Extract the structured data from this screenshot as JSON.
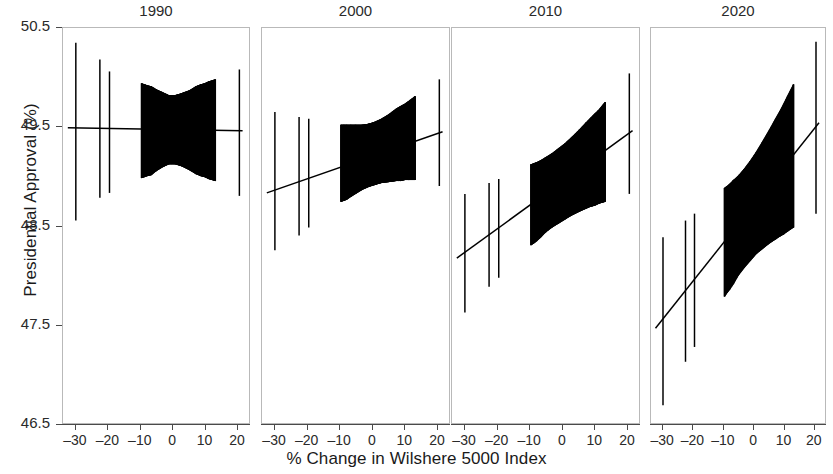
{
  "chart_data": {
    "type": "scatter",
    "title": "",
    "xlabel": "% Change in Wilshere 5000 Index",
    "ylabel": "Presidential Approval (%)",
    "xlim": [
      -34,
      24
    ],
    "ylim": [
      46.5,
      50.5
    ],
    "xticks": [
      -30,
      -20,
      -10,
      0,
      10,
      20
    ],
    "xticklabels": [
      "–30",
      "–20",
      "–10",
      "0",
      "10",
      "20"
    ],
    "yticks": [
      46.5,
      47.5,
      48.5,
      49.5,
      50.5
    ],
    "yticklabels": [
      "46.5",
      "47.5",
      "48.5",
      "49.5",
      "50.5"
    ],
    "grid": false,
    "legend": null,
    "facet_variable": "year",
    "facets": [
      {
        "label": "1990",
        "slope": -0.004,
        "intercept": 49.47,
        "fit_line": [
          {
            "x": -32.5,
            "y": 49.49
          },
          {
            "x": 22.0,
            "y": 49.46
          }
        ],
        "points": [
          {
            "x": -30.0,
            "y": 49.49,
            "ylow": 48.55,
            "yhigh": 50.35
          },
          {
            "x": -22.5,
            "y": 49.49,
            "ylow": 48.78,
            "yhigh": 50.18
          },
          {
            "x": -19.5,
            "y": 49.49,
            "ylow": 48.83,
            "yhigh": 50.06
          },
          {
            "x": -9.5,
            "y": 49.48,
            "ylow": 48.98,
            "yhigh": 49.94
          },
          {
            "x": -8.6,
            "y": 49.48,
            "ylow": 48.99,
            "yhigh": 49.93
          },
          {
            "x": -7.8,
            "y": 49.48,
            "ylow": 49.0,
            "yhigh": 49.92
          },
          {
            "x": -6.5,
            "y": 49.48,
            "ylow": 49.01,
            "yhigh": 49.91
          },
          {
            "x": -5.0,
            "y": 49.48,
            "ylow": 49.05,
            "yhigh": 49.88
          },
          {
            "x": -3.0,
            "y": 49.48,
            "ylow": 49.09,
            "yhigh": 49.85
          },
          {
            "x": -1.0,
            "y": 49.47,
            "ylow": 49.12,
            "yhigh": 49.82
          },
          {
            "x": 1.0,
            "y": 49.47,
            "ylow": 49.12,
            "yhigh": 49.82
          },
          {
            "x": 3.0,
            "y": 49.47,
            "ylow": 49.1,
            "yhigh": 49.84
          },
          {
            "x": 5.5,
            "y": 49.47,
            "ylow": 49.06,
            "yhigh": 49.87
          },
          {
            "x": 7.5,
            "y": 49.47,
            "ylow": 49.02,
            "yhigh": 49.91
          },
          {
            "x": 9.0,
            "y": 49.47,
            "ylow": 49.0,
            "yhigh": 49.93
          },
          {
            "x": 10.2,
            "y": 49.47,
            "ylow": 48.99,
            "yhigh": 49.94
          },
          {
            "x": 11.5,
            "y": 49.46,
            "ylow": 48.97,
            "yhigh": 49.96
          },
          {
            "x": 13.5,
            "y": 49.46,
            "ylow": 48.95,
            "yhigh": 49.98
          },
          {
            "x": 21.0,
            "y": 49.46,
            "ylow": 48.8,
            "yhigh": 50.08
          }
        ]
      },
      {
        "label": "2000",
        "slope": 0.012,
        "intercept": 49.25,
        "fit_line": [
          {
            "x": -32.5,
            "y": 48.83
          },
          {
            "x": 22.0,
            "y": 49.45
          }
        ],
        "points": [
          {
            "x": -30.0,
            "y": 48.86,
            "ylow": 48.25,
            "yhigh": 49.65
          },
          {
            "x": -22.5,
            "y": 48.95,
            "ylow": 48.4,
            "yhigh": 49.6
          },
          {
            "x": -19.5,
            "y": 48.98,
            "ylow": 48.48,
            "yhigh": 49.58
          },
          {
            "x": -9.5,
            "y": 49.1,
            "ylow": 48.74,
            "yhigh": 49.52
          },
          {
            "x": -8.6,
            "y": 49.11,
            "ylow": 48.75,
            "yhigh": 49.52
          },
          {
            "x": -7.8,
            "y": 49.12,
            "ylow": 48.76,
            "yhigh": 49.52
          },
          {
            "x": -6.5,
            "y": 49.13,
            "ylow": 48.79,
            "yhigh": 49.52
          },
          {
            "x": -5.0,
            "y": 49.15,
            "ylow": 48.82,
            "yhigh": 49.52
          },
          {
            "x": -3.0,
            "y": 49.18,
            "ylow": 48.86,
            "yhigh": 49.52
          },
          {
            "x": -1.0,
            "y": 49.2,
            "ylow": 48.89,
            "yhigh": 49.53
          },
          {
            "x": 1.0,
            "y": 49.22,
            "ylow": 48.91,
            "yhigh": 49.55
          },
          {
            "x": 3.0,
            "y": 49.25,
            "ylow": 48.93,
            "yhigh": 49.58
          },
          {
            "x": 5.5,
            "y": 49.28,
            "ylow": 48.94,
            "yhigh": 49.63
          },
          {
            "x": 7.5,
            "y": 49.3,
            "ylow": 48.95,
            "yhigh": 49.68
          },
          {
            "x": 9.0,
            "y": 49.32,
            "ylow": 48.95,
            "yhigh": 49.71
          },
          {
            "x": 10.2,
            "y": 49.34,
            "ylow": 48.96,
            "yhigh": 49.73
          },
          {
            "x": 11.5,
            "y": 49.35,
            "ylow": 48.96,
            "yhigh": 49.76
          },
          {
            "x": 13.5,
            "y": 49.38,
            "ylow": 48.96,
            "yhigh": 49.81
          },
          {
            "x": 21.0,
            "y": 49.45,
            "ylow": 48.9,
            "yhigh": 49.98
          }
        ]
      },
      {
        "label": "2010",
        "slope": 0.024,
        "intercept": 48.92,
        "fit_line": [
          {
            "x": -32.5,
            "y": 48.17
          },
          {
            "x": 22.0,
            "y": 49.46
          }
        ],
        "points": [
          {
            "x": -30.0,
            "y": 48.22,
            "ylow": 47.62,
            "yhigh": 48.82
          },
          {
            "x": -22.5,
            "y": 48.4,
            "ylow": 47.88,
            "yhigh": 48.93
          },
          {
            "x": -19.5,
            "y": 48.47,
            "ylow": 47.97,
            "yhigh": 48.97
          },
          {
            "x": -9.5,
            "y": 48.7,
            "ylow": 48.3,
            "yhigh": 49.12
          },
          {
            "x": -8.6,
            "y": 48.72,
            "ylow": 48.32,
            "yhigh": 49.13
          },
          {
            "x": -7.8,
            "y": 48.74,
            "ylow": 48.34,
            "yhigh": 49.14
          },
          {
            "x": -6.5,
            "y": 48.77,
            "ylow": 48.38,
            "yhigh": 49.16
          },
          {
            "x": -5.0,
            "y": 48.81,
            "ylow": 48.43,
            "yhigh": 49.19
          },
          {
            "x": -3.0,
            "y": 48.85,
            "ylow": 48.48,
            "yhigh": 49.23
          },
          {
            "x": -1.0,
            "y": 48.9,
            "ylow": 48.52,
            "yhigh": 49.28
          },
          {
            "x": 1.0,
            "y": 48.95,
            "ylow": 48.56,
            "yhigh": 49.33
          },
          {
            "x": 3.0,
            "y": 49.0,
            "ylow": 48.6,
            "yhigh": 49.39
          },
          {
            "x": 5.5,
            "y": 49.06,
            "ylow": 48.64,
            "yhigh": 49.47
          },
          {
            "x": 7.5,
            "y": 49.1,
            "ylow": 48.67,
            "yhigh": 49.54
          },
          {
            "x": 9.0,
            "y": 49.14,
            "ylow": 48.69,
            "yhigh": 49.59
          },
          {
            "x": 10.2,
            "y": 49.17,
            "ylow": 48.7,
            "yhigh": 49.63
          },
          {
            "x": 11.5,
            "y": 49.2,
            "ylow": 48.72,
            "yhigh": 49.67
          },
          {
            "x": 13.5,
            "y": 49.24,
            "ylow": 48.74,
            "yhigh": 49.75
          },
          {
            "x": 21.0,
            "y": 49.45,
            "ylow": 48.82,
            "yhigh": 50.04
          }
        ]
      },
      {
        "label": "2020",
        "slope": 0.038,
        "intercept": 48.7,
        "fit_line": [
          {
            "x": -32.5,
            "y": 47.46
          },
          {
            "x": 22.0,
            "y": 49.54
          }
        ],
        "points": [
          {
            "x": -30.0,
            "y": 47.54,
            "ylow": 46.68,
            "yhigh": 48.38
          },
          {
            "x": -22.5,
            "y": 47.83,
            "ylow": 47.12,
            "yhigh": 48.55
          },
          {
            "x": -19.5,
            "y": 47.94,
            "ylow": 47.27,
            "yhigh": 48.62
          },
          {
            "x": -9.5,
            "y": 48.32,
            "ylow": 47.78,
            "yhigh": 48.88
          },
          {
            "x": -8.6,
            "y": 48.36,
            "ylow": 47.82,
            "yhigh": 48.9
          },
          {
            "x": -7.8,
            "y": 48.39,
            "ylow": 47.85,
            "yhigh": 48.92
          },
          {
            "x": -6.5,
            "y": 48.44,
            "ylow": 47.91,
            "yhigh": 48.96
          },
          {
            "x": -5.0,
            "y": 48.5,
            "ylow": 47.99,
            "yhigh": 49.0
          },
          {
            "x": -3.0,
            "y": 48.57,
            "ylow": 48.07,
            "yhigh": 49.07
          },
          {
            "x": -1.0,
            "y": 48.65,
            "ylow": 48.14,
            "yhigh": 49.15
          },
          {
            "x": 1.0,
            "y": 48.73,
            "ylow": 48.21,
            "yhigh": 49.24
          },
          {
            "x": 3.0,
            "y": 48.8,
            "ylow": 48.26,
            "yhigh": 49.34
          },
          {
            "x": 5.5,
            "y": 48.9,
            "ylow": 48.32,
            "yhigh": 49.47
          },
          {
            "x": 7.5,
            "y": 48.97,
            "ylow": 48.36,
            "yhigh": 49.58
          },
          {
            "x": 9.0,
            "y": 49.03,
            "ylow": 48.39,
            "yhigh": 49.66
          },
          {
            "x": 10.2,
            "y": 49.08,
            "ylow": 48.41,
            "yhigh": 49.73
          },
          {
            "x": 11.5,
            "y": 49.13,
            "ylow": 48.44,
            "yhigh": 49.81
          },
          {
            "x": 13.5,
            "y": 49.2,
            "ylow": 48.48,
            "yhigh": 49.93
          },
          {
            "x": 21.0,
            "y": 49.49,
            "ylow": 48.62,
            "yhigh": 50.36
          }
        ]
      }
    ]
  },
  "colors": {
    "ink": "#000000",
    "axis": "#4a4a4a",
    "panel_border": "#b9b9b9",
    "background": "#ffffff"
  }
}
